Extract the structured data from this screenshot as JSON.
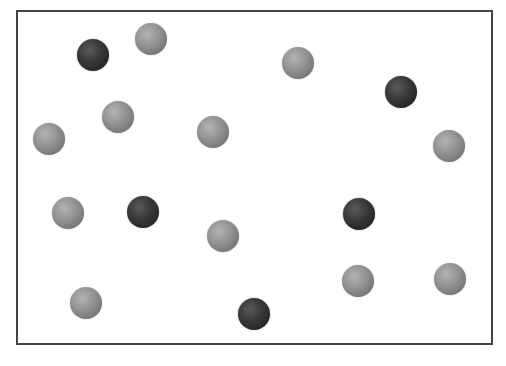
{
  "diagram": {
    "frame": {
      "x": 16,
      "y": 10,
      "width": 475,
      "height": 333,
      "border_color": "#444444"
    },
    "colors": {
      "light": "#8c8c8c",
      "dark": "#2e2e2e"
    },
    "sphere_diameter": 32,
    "counts": {
      "light": 11,
      "dark": 5,
      "total": 16
    },
    "spheres": [
      {
        "type": "dark",
        "x": 93,
        "y": 55
      },
      {
        "type": "light",
        "x": 151,
        "y": 39
      },
      {
        "type": "light",
        "x": 298,
        "y": 63
      },
      {
        "type": "dark",
        "x": 401,
        "y": 92
      },
      {
        "type": "light",
        "x": 118,
        "y": 117
      },
      {
        "type": "light",
        "x": 49,
        "y": 139
      },
      {
        "type": "light",
        "x": 213,
        "y": 132
      },
      {
        "type": "light",
        "x": 449,
        "y": 146
      },
      {
        "type": "light",
        "x": 68,
        "y": 213
      },
      {
        "type": "dark",
        "x": 143,
        "y": 212
      },
      {
        "type": "dark",
        "x": 359,
        "y": 214
      },
      {
        "type": "light",
        "x": 223,
        "y": 236
      },
      {
        "type": "light",
        "x": 358,
        "y": 281
      },
      {
        "type": "light",
        "x": 450,
        "y": 279
      },
      {
        "type": "light",
        "x": 86,
        "y": 303
      },
      {
        "type": "dark",
        "x": 254,
        "y": 314
      }
    ]
  }
}
